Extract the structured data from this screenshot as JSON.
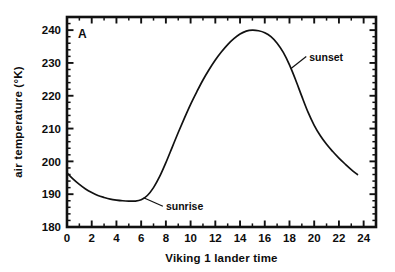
{
  "figure": {
    "panel_label": "A",
    "background_color": "#ffffff",
    "ink_color": "#111111"
  },
  "chart_data": {
    "type": "line",
    "title": "",
    "subtitle": "",
    "xlabel": "Viking 1 lander time",
    "ylabel": "air temperature (°K)",
    "xlim": [
      0,
      25
    ],
    "ylim": [
      180,
      244
    ],
    "grid": false,
    "legend": false,
    "legend_position": "none",
    "x_major_ticks": [
      0,
      2,
      4,
      6,
      8,
      10,
      12,
      14,
      16,
      18,
      20,
      22,
      24
    ],
    "x_major_tick_labels": [
      "0",
      "2",
      "4",
      "6",
      "8",
      "10",
      "12",
      "14",
      "16",
      "18",
      "20",
      "22",
      "24"
    ],
    "x_minor_tick_step": 1,
    "y_major_ticks": [
      180,
      190,
      200,
      210,
      220,
      230,
      240
    ],
    "y_major_tick_labels": [
      "180",
      "190",
      "200",
      "210",
      "220",
      "230",
      "240"
    ],
    "y_minor_tick_step": 2,
    "series": [
      {
        "name": "air temperature",
        "units": "K",
        "x": [
          0.0,
          0.5,
          1.0,
          1.5,
          2.0,
          2.5,
          3.0,
          3.5,
          4.0,
          4.5,
          5.0,
          5.5,
          6.0,
          6.5,
          7.0,
          7.5,
          8.0,
          8.5,
          9.0,
          9.5,
          10.0,
          10.5,
          11.0,
          11.5,
          12.0,
          12.5,
          13.0,
          13.5,
          14.0,
          14.5,
          15.0,
          15.5,
          16.0,
          16.5,
          17.0,
          17.5,
          18.0,
          18.5,
          19.0,
          19.5,
          20.0,
          20.5,
          21.0,
          21.5,
          22.0,
          22.5,
          23.0,
          23.5
        ],
        "y": [
          196.5,
          194.6,
          193.0,
          191.6,
          190.5,
          189.6,
          189.0,
          188.5,
          188.2,
          188.0,
          187.9,
          187.9,
          188.3,
          189.6,
          192.0,
          195.4,
          199.6,
          204.2,
          208.8,
          213.2,
          217.4,
          221.2,
          224.8,
          228.0,
          230.9,
          233.4,
          235.6,
          237.4,
          238.8,
          239.7,
          240.0,
          239.8,
          239.2,
          238.0,
          236.0,
          233.2,
          229.4,
          224.8,
          219.8,
          215.0,
          211.0,
          207.8,
          205.2,
          203.0,
          201.0,
          199.2,
          197.5,
          196.0
        ]
      }
    ],
    "annotations": [
      {
        "text": "sunrise",
        "point_x": 6.2,
        "point_y": 188.9,
        "text_x": 8.0,
        "text_y": 187.4
      },
      {
        "text": "sunset",
        "point_x": 18.1,
        "point_y": 228.2,
        "text_x": 19.6,
        "text_y": 233.0
      }
    ]
  }
}
